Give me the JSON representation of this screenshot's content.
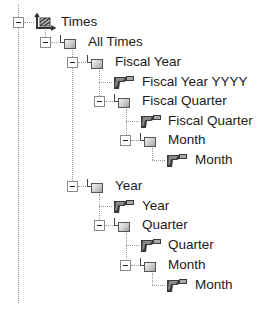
{
  "tree": {
    "root": {
      "label": "Times",
      "icon": "dimension-icon",
      "expanded": true,
      "children": [
        {
          "label": "All Times",
          "icon": "level-icon",
          "expanded": true
        }
      ]
    },
    "nodes": [
      {
        "id": "times",
        "label": "Times",
        "icon": "dimension-icon",
        "type": "dimension",
        "expanded": true
      },
      {
        "id": "all-times",
        "label": "All Times",
        "icon": "level-icon",
        "type": "level",
        "expanded": true
      },
      {
        "id": "fiscal-year",
        "label": "Fiscal Year",
        "icon": "level-icon",
        "type": "level",
        "expanded": true
      },
      {
        "id": "fiscal-year-yyyy",
        "label": "Fiscal Year YYYY",
        "icon": "attribute-icon",
        "type": "attribute"
      },
      {
        "id": "fiscal-quarter",
        "label": "Fiscal Quarter",
        "icon": "level-icon",
        "type": "level",
        "expanded": true
      },
      {
        "id": "fiscal-quarter-attr",
        "label": "Fiscal Quarter",
        "icon": "attribute-icon",
        "type": "attribute"
      },
      {
        "id": "fiscal-month",
        "label": "Month",
        "icon": "level-icon",
        "type": "level",
        "expanded": true
      },
      {
        "id": "fiscal-month-attr",
        "label": "Month",
        "icon": "attribute-icon",
        "type": "attribute"
      },
      {
        "id": "year",
        "label": "Year",
        "icon": "level-icon",
        "type": "level",
        "expanded": true
      },
      {
        "id": "year-attr",
        "label": "Year",
        "icon": "attribute-icon",
        "type": "attribute"
      },
      {
        "id": "quarter",
        "label": "Quarter",
        "icon": "level-icon",
        "type": "level",
        "expanded": true
      },
      {
        "id": "quarter-attr",
        "label": "Quarter",
        "icon": "attribute-icon",
        "type": "attribute"
      },
      {
        "id": "month",
        "label": "Month",
        "icon": "level-icon",
        "type": "level",
        "expanded": true
      },
      {
        "id": "month-attr",
        "label": "Month",
        "icon": "attribute-icon",
        "type": "attribute"
      }
    ]
  },
  "colors": {
    "text": "#1a1a1a",
    "lines": "#9a9a9a",
    "background": "#ffffff"
  }
}
